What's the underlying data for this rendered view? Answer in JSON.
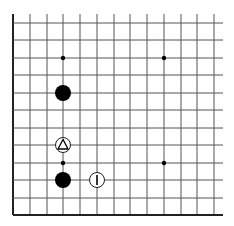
{
  "board": {
    "description": "Go board fragment (lower-left corner region)",
    "columns_x": [
      13,
      30,
      47,
      63,
      80,
      97,
      114,
      130,
      147,
      164,
      181,
      197,
      214
    ],
    "rows_y": [
      23,
      40,
      58,
      75,
      93,
      110,
      128,
      145,
      163,
      180,
      198,
      215
    ],
    "line_color": "#555555",
    "edge_color": "#222222",
    "left_edge": true,
    "bottom_edge": true,
    "star_points": [
      {
        "col": 3,
        "row": 2
      },
      {
        "col": 9,
        "row": 2
      },
      {
        "col": 3,
        "row": 8
      },
      {
        "col": 9,
        "row": 8
      }
    ],
    "stones": [
      {
        "col": 3,
        "row": 4,
        "color": "black",
        "mark": ""
      },
      {
        "col": 3,
        "row": 9,
        "color": "black",
        "mark": ""
      },
      {
        "col": 3,
        "row": 7,
        "color": "white",
        "mark": "triangle"
      },
      {
        "col": 5,
        "row": 9,
        "color": "white",
        "mark": "I"
      }
    ]
  }
}
